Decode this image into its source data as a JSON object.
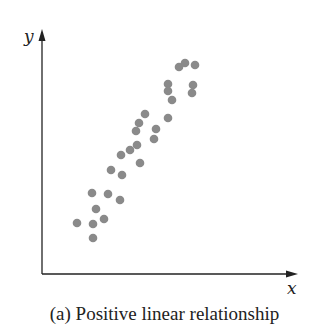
{
  "caption": "(a) Positive linear relationship",
  "colors": {
    "point": "#8a8a8a",
    "axis": "#222222"
  },
  "chart_data": {
    "type": "scatter",
    "title": "(a) Positive linear relationship",
    "xlabel": "x",
    "ylabel": "y",
    "grid": false,
    "legend": null,
    "ticks": "none",
    "note": "Coordinates are unitless positions relative to axes origin (x right, y up), in pixel-scale units.",
    "points": [
      {
        "x": 35,
        "y": 51
      },
      {
        "x": 51,
        "y": 50
      },
      {
        "x": 51,
        "y": 36
      },
      {
        "x": 54,
        "y": 65
      },
      {
        "x": 62,
        "y": 55
      },
      {
        "x": 50,
        "y": 81
      },
      {
        "x": 66,
        "y": 80
      },
      {
        "x": 78,
        "y": 74
      },
      {
        "x": 69,
        "y": 104
      },
      {
        "x": 80,
        "y": 99
      },
      {
        "x": 79,
        "y": 119
      },
      {
        "x": 88,
        "y": 124
      },
      {
        "x": 95,
        "y": 129
      },
      {
        "x": 98,
        "y": 111
      },
      {
        "x": 94,
        "y": 143
      },
      {
        "x": 97,
        "y": 151
      },
      {
        "x": 103,
        "y": 160
      },
      {
        "x": 114,
        "y": 145
      },
      {
        "x": 112,
        "y": 135
      },
      {
        "x": 126,
        "y": 156
      },
      {
        "x": 126,
        "y": 190
      },
      {
        "x": 126,
        "y": 183
      },
      {
        "x": 130,
        "y": 174
      },
      {
        "x": 137,
        "y": 207
      },
      {
        "x": 143,
        "y": 211
      },
      {
        "x": 153,
        "y": 209
      },
      {
        "x": 151,
        "y": 189
      },
      {
        "x": 150,
        "y": 181
      }
    ],
    "pixel_points": [
      [
        77,
        223
      ],
      [
        93,
        224
      ],
      [
        93,
        238
      ],
      [
        96,
        209
      ],
      [
        104,
        219
      ],
      [
        92,
        193
      ],
      [
        108,
        194
      ],
      [
        120,
        200
      ],
      [
        111,
        170
      ],
      [
        122,
        175
      ],
      [
        121,
        155
      ],
      [
        130,
        150
      ],
      [
        137,
        145
      ],
      [
        140,
        163
      ],
      [
        136,
        131
      ],
      [
        139,
        123
      ],
      [
        145,
        114
      ],
      [
        156,
        129
      ],
      [
        154,
        139
      ],
      [
        168,
        118
      ],
      [
        168,
        84
      ],
      [
        168,
        91
      ],
      [
        172,
        100
      ],
      [
        179,
        67
      ],
      [
        185,
        63
      ],
      [
        195,
        65
      ],
      [
        193,
        85
      ],
      [
        192,
        93
      ]
    ],
    "axes": {
      "origin": [
        42,
        274
      ],
      "y_axis_top": 30,
      "x_axis_right": 297
    }
  }
}
